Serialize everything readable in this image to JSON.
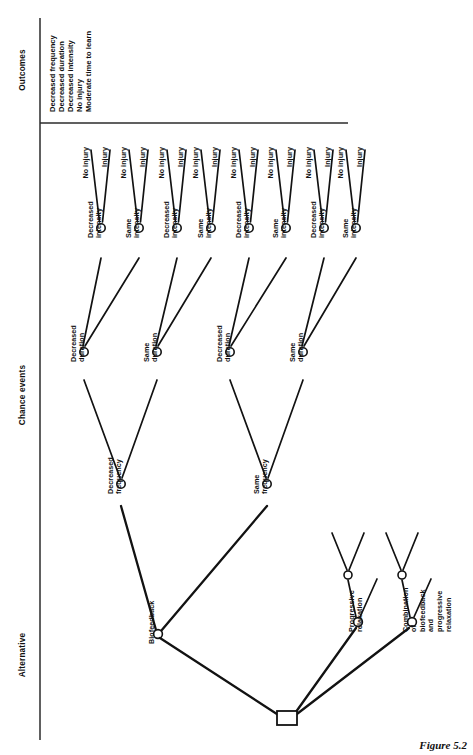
{
  "figure": {
    "caption": "Figure 5.2",
    "orientation": "rotated-90"
  },
  "sections": [
    {
      "id": "outcomes",
      "label": "Outcomes"
    },
    {
      "id": "chance-events",
      "label": "Chance events"
    },
    {
      "id": "alternative",
      "label": "Alternative"
    }
  ],
  "outcomes_list": [
    "Decreased frequency",
    "Decreased duration",
    "Decreased intensity",
    "No injury",
    "Moderate time to learn"
  ],
  "alternatives": [
    {
      "id": "biofeedback",
      "label": "Biofeedback"
    },
    {
      "id": "progressive-relaxation",
      "label": "Progressive\nrelaxation"
    },
    {
      "id": "combination",
      "label": "Combination\nof\nbiofeedback\nand\nprogressive\nrelaxation"
    }
  ],
  "frequency_branches": [
    "Decreased\nfrequency",
    "Same\nfrequency"
  ],
  "duration_branches": [
    "Decreased\nduration",
    "Same\nduration",
    "Decreased\nduration",
    "Same\nduration"
  ],
  "intensity_branches": [
    "Decreased\nintensity",
    "Same\nintensity",
    "Decreased\nintensity",
    "Same\nintensity",
    "Decreased\nintensity",
    "Same\nintensity",
    "Decreased\nintensity",
    "Same\nintensity"
  ],
  "injury_branches": [
    "No injury",
    "Injury",
    "No injury",
    "Injury",
    "No injury",
    "Injury",
    "No injury",
    "Injury",
    "No injury",
    "Injury",
    "No injury",
    "Injury",
    "No injury",
    "Injury",
    "No injury",
    "Injury"
  ],
  "colors": {
    "line": "#121212",
    "node_fill": "#ffffff",
    "text": "#111111",
    "axis": "#2b2b2b",
    "background": "#ffffff"
  },
  "geometry": {
    "decision_node": {
      "x": 287,
      "y": 718
    },
    "frequency_nodes_y": 484,
    "duration_nodes_y": 352,
    "intensity_nodes_y": 228,
    "leaf_line_top": 150,
    "axis_x": 40,
    "divider_y": 123
  }
}
